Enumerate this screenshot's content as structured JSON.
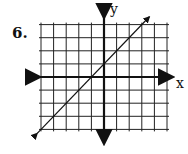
{
  "problem_number": "6.",
  "axes": {
    "x_label": "x",
    "y_label": "y"
  },
  "chart_data": {
    "type": "line",
    "title": "",
    "xlabel": "x",
    "ylabel": "y",
    "xlim": [
      -5,
      5
    ],
    "ylim": [
      -4,
      4
    ],
    "grid": true,
    "tick_labels": false,
    "series": [
      {
        "name": "y = x + 1",
        "x": [
          -5,
          -1,
          0,
          3
        ],
        "y": [
          -4,
          0,
          1,
          4
        ],
        "arrows_both_ends": true
      }
    ]
  }
}
